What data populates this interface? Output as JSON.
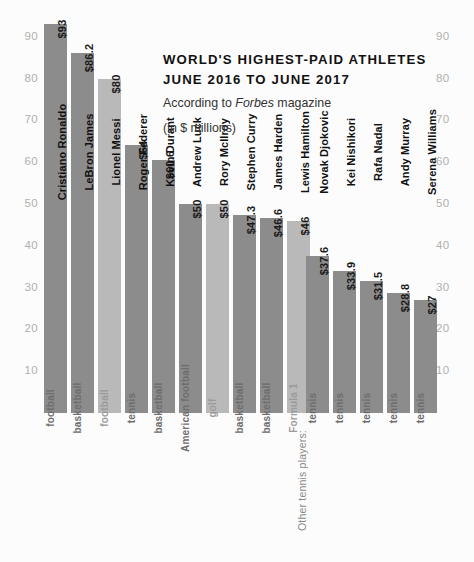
{
  "header": {
    "title_line1": "WORLD'S HIGHEST-PAID ATHLETES",
    "title_line2": "JUNE 2016 TO JUNE 2017",
    "subtitle_prefix": "According to ",
    "subtitle_source": "Forbes",
    "subtitle_suffix": " magazine",
    "units_note": "(in $ millions)"
  },
  "group_caption": "Other tennis players:",
  "chart_data": {
    "type": "bar",
    "title": "WORLD'S HIGHEST-PAID ATHLETES JUNE 2016 TO JUNE 2017",
    "subtitle": "According to Forbes magazine (in $ millions)",
    "xlabel": "",
    "ylabel": "",
    "ylim": [
      0,
      95
    ],
    "grid": false,
    "legend": "none",
    "axis_ticks": [
      10,
      20,
      30,
      40,
      50,
      60,
      70,
      80,
      90
    ],
    "axis_tick_labels": [
      "10",
      "20",
      "30",
      "40",
      "50",
      "60",
      "70",
      "80",
      "90"
    ],
    "left_axis": true,
    "right_axis": true,
    "categories": [
      "Cristiano Ronaldo",
      "LeBron James",
      "Lionel Messi",
      "Roger Federer",
      "Kevin Durant",
      "Andrew Luck",
      "Rory McIlroy",
      "Stephen Curry",
      "James Harden",
      "Lewis Hamilton",
      "Novak Djokovic",
      "Kei Nishikori",
      "Rafa Nadal",
      "Andy Murray",
      "Serena Williams"
    ],
    "values": [
      93,
      86.2,
      80,
      64,
      60.6,
      50,
      50,
      47.3,
      46.6,
      46,
      37.6,
      33.9,
      31.5,
      28.8,
      27
    ],
    "value_labels": [
      "$93",
      "$86.2",
      "$80",
      "$64",
      "$60.6",
      "$50",
      "$50",
      "$47.3",
      "$46.6",
      "$46",
      "$37.6",
      "$33.9",
      "$31.5",
      "$28.8",
      "$27"
    ],
    "sports": [
      "football",
      "basketball",
      "football",
      "tennis",
      "basketball",
      "American football",
      "golf",
      "basketball",
      "basketball",
      "Formula 1",
      "tennis",
      "tennis",
      "tennis",
      "tennis",
      "tennis"
    ],
    "bar_shades": [
      "dark",
      "dark",
      "light",
      "dark",
      "dark",
      "dark",
      "light",
      "dark",
      "dark",
      "light",
      "dark",
      "dark",
      "dark",
      "dark",
      "dark"
    ],
    "groups": [
      {
        "name": "main",
        "indices": [
          0,
          1,
          2,
          3,
          4,
          5,
          6,
          7,
          8,
          9
        ]
      },
      {
        "name": "other-tennis-players",
        "caption": "Other tennis players:",
        "indices": [
          10,
          11,
          12,
          13,
          14
        ]
      }
    ],
    "colors": {
      "bar_dark": "#8c8c8c",
      "bar_light": "#b9b9b9",
      "axis_text": "#b0b0b0",
      "text": "#111111"
    }
  }
}
